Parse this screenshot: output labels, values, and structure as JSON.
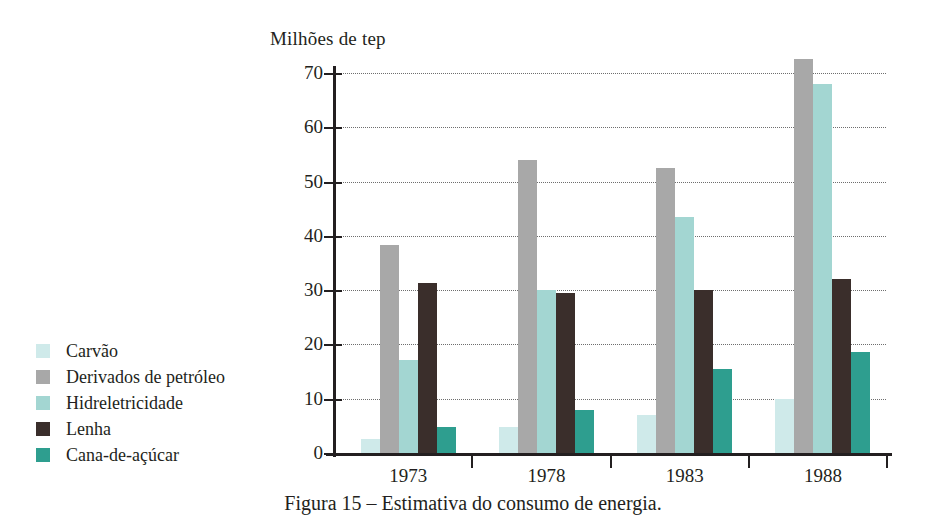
{
  "axis_title": "Milhões de tep",
  "caption": "Figura 15 – Estimativa do consumo de energia.",
  "legend": {
    "items": [
      {
        "label": "Carvão",
        "color": "#cfeaea"
      },
      {
        "label": "Derivados de petróleo",
        "color": "#a8a8a8"
      },
      {
        "label": "Hidreletricidade",
        "color": "#a3d6d2"
      },
      {
        "label": "Lenha",
        "color": "#3a2e2b"
      },
      {
        "label": "Cana-de-açúcar",
        "color": "#2e9e8f"
      }
    ]
  },
  "chart_data": {
    "type": "bar",
    "title": "",
    "xlabel": "",
    "ylabel": "Milhões de tep",
    "ylim": [
      0,
      70
    ],
    "yticks": [
      0,
      10,
      20,
      30,
      40,
      50,
      60,
      70
    ],
    "ytick_labels": [
      "0",
      "10",
      "20",
      "30",
      "40",
      "50",
      "60",
      "70"
    ],
    "grid": true,
    "legend_position": "left-outside",
    "categories": [
      "1973",
      "1978",
      "1983",
      "1988"
    ],
    "series": [
      {
        "name": "Carvão",
        "color": "#cfeaea",
        "values": [
          2.5,
          4.8,
          7.0,
          10.0
        ]
      },
      {
        "name": "Derivados de petróleo",
        "color": "#a8a8a8",
        "values": [
          38.3,
          54.0,
          52.5,
          72.5
        ]
      },
      {
        "name": "Hidreletricidade",
        "color": "#a3d6d2",
        "values": [
          17.2,
          30.1,
          43.5,
          68.0
        ]
      },
      {
        "name": "Lenha",
        "color": "#3a2e2b",
        "values": [
          31.3,
          29.5,
          30.1,
          32.0
        ]
      },
      {
        "name": "Cana-de-açúcar",
        "color": "#2e9e8f",
        "values": [
          4.8,
          7.9,
          15.4,
          18.7
        ]
      }
    ]
  }
}
